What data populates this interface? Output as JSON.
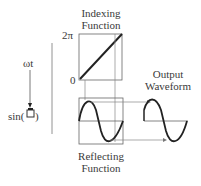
{
  "diagram": {
    "indexing": {
      "title_line1": "Indexing",
      "title_line2": "Function",
      "y_max_label": "2π",
      "y_min_label": "0"
    },
    "reflecting": {
      "title_line1": "Reflecting",
      "title_line2": "Function"
    },
    "output": {
      "title_line1": "Output",
      "title_line2": "Waveform"
    },
    "input": {
      "label": "ωt",
      "function_label": "sin(",
      "function_close": ")"
    },
    "colors": {
      "stroke": "#222222",
      "box": "#555555",
      "arrow": "#777777"
    }
  }
}
